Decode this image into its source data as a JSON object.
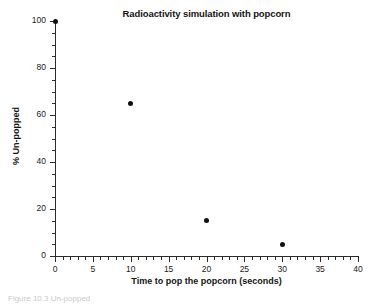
{
  "chart_data": {
    "type": "scatter",
    "title": "Radioactivity simulation with popcorn",
    "xlabel": "Time to pop the popcorn (seconds)",
    "ylabel": "% Un-popped",
    "xlim": [
      0,
      40
    ],
    "ylim": [
      0,
      100
    ],
    "grid": false,
    "legend": null,
    "x": [
      0,
      10,
      20,
      30
    ],
    "values": [
      100,
      65,
      15,
      5
    ],
    "series": [
      {
        "name": "% Un-popped",
        "marker": "filled-circle",
        "color": "#101010",
        "points": [
          {
            "x": 0,
            "y": 100
          },
          {
            "x": 10,
            "y": 65
          },
          {
            "x": 20,
            "y": 15
          },
          {
            "x": 30,
            "y": 5
          }
        ]
      }
    ],
    "x_ticks_major": [
      0,
      5,
      10,
      15,
      20,
      25,
      30,
      35,
      40
    ],
    "x_tick_labels": [
      "0",
      "5",
      "10",
      "15",
      "20",
      "25",
      "30",
      "35",
      "40"
    ],
    "x_tick_minor_step": 1,
    "y_ticks_major": [
      0,
      20,
      40,
      60,
      80,
      100
    ],
    "y_tick_labels": [
      "0",
      "20",
      "40",
      "60",
      "80",
      "100"
    ],
    "y_tick_minor_step": 5
  },
  "figure": {
    "caption": "Figure 10.3  Un-popped"
  }
}
